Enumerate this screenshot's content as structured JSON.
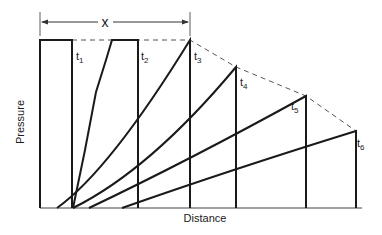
{
  "diagram": {
    "x_axis_label": "Distance",
    "y_axis_label": "Pressure",
    "span_label": "x",
    "time_labels": [
      {
        "base": "t",
        "sub": "1"
      },
      {
        "base": "t",
        "sub": "2"
      },
      {
        "base": "t",
        "sub": "3"
      },
      {
        "base": "t",
        "sub": "4"
      },
      {
        "base": "t",
        "sub": "5"
      },
      {
        "base": "t",
        "sub": "6"
      }
    ],
    "line_color": "#1a1a1a",
    "dashed_color": "#555555"
  }
}
